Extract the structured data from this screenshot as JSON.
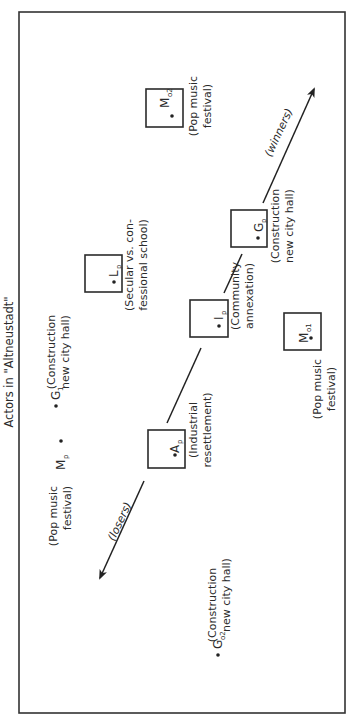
{
  "title": "Actors in \"Altneustadt\"",
  "arrows": {
    "winners": "(winners)",
    "losers": "(losers)"
  },
  "actors": {
    "M_o2": {
      "symbol": "M",
      "subscript": "o2",
      "label_line1": "(Pop music",
      "label_line2": "festival)",
      "boxed": true
    },
    "G_p": {
      "symbol": "G",
      "subscript": "p",
      "label_line1": "(Construction",
      "label_line2": "new city hall)",
      "boxed": true
    },
    "L_p": {
      "symbol": "L",
      "subscript": "p",
      "label_line1": "(Secular vs. con-",
      "label_line2": "fessional school)",
      "boxed": true
    },
    "I_p": {
      "symbol": "I",
      "subscript": "p",
      "label_line1": "(Community",
      "label_line2": "annexation)",
      "boxed": true
    },
    "M_o1": {
      "symbol": "M",
      "subscript": "o1",
      "label_line1": "(Pop music",
      "label_line2": "festival)",
      "boxed": true
    },
    "A_p": {
      "symbol": "A",
      "subscript": "p",
      "label_line1": "(Industrial",
      "label_line2": "resettlement)",
      "boxed": true
    },
    "G_1": {
      "symbol": "G",
      "subscript": "1",
      "label_line1": "(Construction",
      "label_line2": "new city hall)",
      "boxed": false
    },
    "M_p": {
      "symbol": "M",
      "subscript": "p",
      "label_line1": "(Pop music",
      "label_line2": "festival)",
      "boxed": false
    },
    "G_o2": {
      "symbol": "G",
      "subscript": "o2",
      "label_line1": "(Construction",
      "label_line2": "new city hall)",
      "boxed": false
    }
  },
  "colors": {
    "ink": "#2b2b2b",
    "background": "#ffffff"
  }
}
